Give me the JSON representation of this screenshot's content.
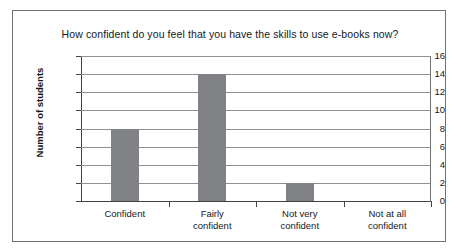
{
  "chart_data": {
    "type": "bar",
    "title": "How confident do you feel that you have the skills to use e-books now?",
    "xlabel": "",
    "ylabel": "Number of students",
    "categories": [
      "Confident",
      "Fairly confident",
      "Not very confident",
      "Not at all confident"
    ],
    "category_lines": [
      [
        "Confident"
      ],
      [
        "Fairly",
        "confident"
      ],
      [
        "Not very",
        "confident"
      ],
      [
        "Not at all",
        "confident"
      ]
    ],
    "values": [
      8,
      14,
      2,
      0
    ],
    "ylim": [
      0,
      16
    ],
    "ytick_step": 2,
    "yticks": [
      "16",
      "14",
      "12",
      "10",
      "8",
      "6",
      "4",
      "2",
      "0"
    ],
    "grid": true,
    "legend": "none",
    "bar_color": "#808285",
    "gridline_color": "#8d9094",
    "axis_color": "#3f4246",
    "frame_color": "#6f7276",
    "background": "#ffffff"
  }
}
